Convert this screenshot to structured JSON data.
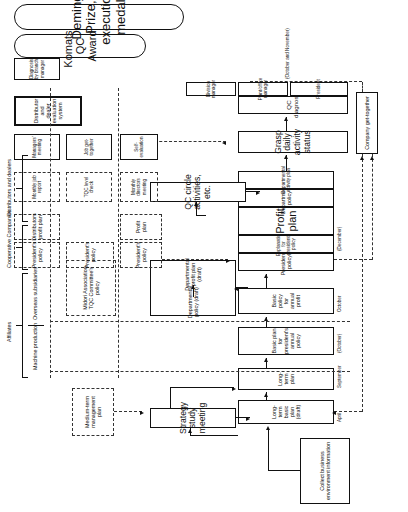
{
  "diagram": {
    "orientation": "rotated-90-ccw",
    "groups": {
      "affiliates": "Affiliates",
      "machine_production": "Machine production",
      "overseas_subsidiaries": "Overseas subsidiaries",
      "cooperative_companies": "Cooperative Companies",
      "distributors_dealers": "Distributors and dealers"
    },
    "nodes": [
      {
        "id": "collect-info",
        "label": "Collect business environment information"
      },
      {
        "id": "long-term-basic",
        "label": "Long-term basic plan (draft)",
        "month": "April"
      },
      {
        "id": "long-term-plan",
        "label": "Long-term plan",
        "month": "September"
      },
      {
        "id": "basic-plan-pres",
        "label": "Basic plan for president's annual policy",
        "month": "(October)"
      },
      {
        "id": "basic-policy-profit",
        "label": "Basic policy for annual profit",
        "month": "October"
      },
      {
        "id": "presidents-policy",
        "label": "President's policy"
      },
      {
        "id": "explanation-policy",
        "label": "Explanation for president's policy",
        "month": "(December)"
      },
      {
        "id": "profit-plan",
        "label": "Profit plan"
      },
      {
        "id": "departmental-policy",
        "label": "Departmental policy"
      },
      {
        "id": "departmental-activity-plan",
        "label": "Departmental activity plan"
      },
      {
        "id": "strategy-study",
        "label": "Strategy study meeting"
      },
      {
        "id": "dept-policy-draft",
        "label": "Departmental policy (draft)"
      },
      {
        "id": "dept-profit-draft",
        "label": "Departmental profit plan (draft)"
      },
      {
        "id": "medium-term",
        "label": "Medium-term management plan"
      },
      {
        "id": "qc-circle",
        "label": "QC circle activities, etc."
      },
      {
        "id": "grasp-daily",
        "label": "Grasp daily activity status"
      },
      {
        "id": "qc-diagnosis",
        "label": "QC diagnosis"
      },
      {
        "id": "qc-president",
        "label": "President"
      },
      {
        "id": "qc-plant-office",
        "label": "Plant/office manager"
      },
      {
        "id": "qc-division",
        "label": "Division manager"
      },
      {
        "id": "qc-months",
        "label": "(October and November)"
      },
      {
        "id": "monthly-directors",
        "label": "Monthly directors meeting"
      },
      {
        "id": "tqc-level-check",
        "label": "TQC level check"
      },
      {
        "id": "monthly-job-report",
        "label": "Monthly job report"
      },
      {
        "id": "self-evaluation",
        "label": "Self-evaluation"
      },
      {
        "id": "job-get-together",
        "label": "Job get-together"
      },
      {
        "id": "managers-meeting",
        "label": "Managers' meeting"
      },
      {
        "id": "company-get-together",
        "label": "Company get-together"
      },
      {
        "id": "midori-policy",
        "label": "Midori Association TQC Committee's policy"
      },
      {
        "id": "pres-policy-a",
        "label": "President's policy"
      },
      {
        "id": "pres-policy-b",
        "label": "President's policy"
      },
      {
        "id": "pres-policy-c",
        "label": "President's policy"
      },
      {
        "id": "profit-plan-b",
        "label": "Profit plan"
      },
      {
        "id": "distributors-profit",
        "label": "Distributors profit plan"
      },
      {
        "id": "distributor-eval",
        "label": "Distributor and dealer evaluation system"
      },
      {
        "id": "diagnosis-branch",
        "label": "Diagnosis by branch manager"
      },
      {
        "id": "komatsu-award",
        "label": "Komatsu QC Award"
      },
      {
        "id": "deming-prize",
        "label": "Deming Prize, execution medal"
      }
    ]
  }
}
